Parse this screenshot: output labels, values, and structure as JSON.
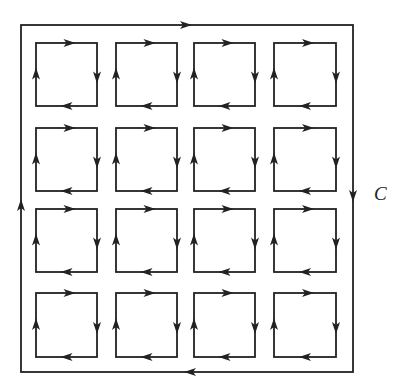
{
  "diagram": {
    "curve_label": "C",
    "outer": {
      "x1": 21,
      "y1": 25,
      "x2": 353,
      "y2": 372,
      "orientation": "clockwise"
    },
    "grid": {
      "rows": 4,
      "cols": 4,
      "col_x": [
        [
          36,
          97
        ],
        [
          116,
          177
        ],
        [
          194,
          255
        ],
        [
          274,
          336
        ]
      ],
      "row_y": [
        [
          43,
          106
        ],
        [
          128,
          191
        ],
        [
          209,
          272
        ],
        [
          293,
          357
        ]
      ],
      "orientation": "clockwise"
    },
    "colors": {
      "stroke": "#222222",
      "background": "#ffffff"
    }
  }
}
